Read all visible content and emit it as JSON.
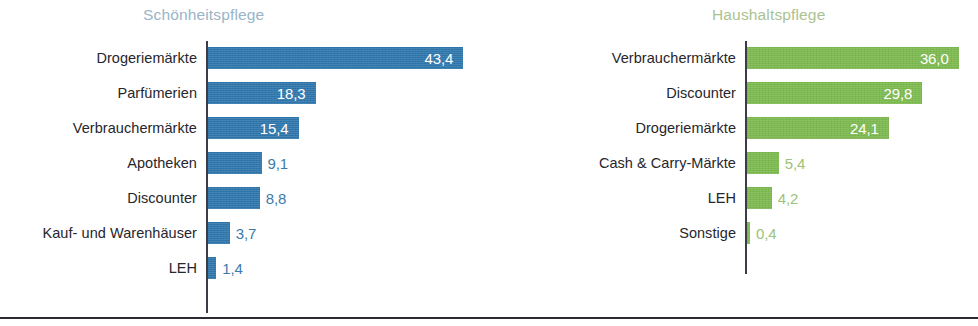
{
  "chart_data": [
    {
      "type": "bar",
      "orientation": "horizontal",
      "title": "Schönheitspflege",
      "title_color": "#9ab4c8",
      "bar_color": "#2e76ac",
      "xlabel": "",
      "ylabel": "",
      "xlim": [
        0,
        43.4
      ],
      "grid": false,
      "legend": false,
      "categories": [
        "Drogeriemärkte",
        "Parfümerien",
        "Verbrauchermärkte",
        "Apotheken",
        "Discounter",
        "Kauf- und Warenhäuser",
        "LEH"
      ],
      "values": [
        43.4,
        18.3,
        15.4,
        9.1,
        8.8,
        3.7,
        1.4
      ],
      "value_labels": [
        "43,4",
        "18,3",
        "15,4",
        "9,1",
        "8,8",
        "3,7",
        "1,4"
      ],
      "label_placement": [
        "inside",
        "inside",
        "inside",
        "outside",
        "outside",
        "outside",
        "outside"
      ]
    },
    {
      "type": "bar",
      "orientation": "horizontal",
      "title": "Haushaltspflege",
      "title_color": "#aac291",
      "bar_color": "#7cb94e",
      "xlabel": "",
      "ylabel": "",
      "xlim": [
        0,
        43.4
      ],
      "grid": false,
      "legend": false,
      "categories": [
        "Verbrauchermärkte",
        "Discounter",
        "Drogeriemärkte",
        "Cash & Carry-Märkte",
        "LEH",
        "Sonstige"
      ],
      "values": [
        36.0,
        29.8,
        24.1,
        5.4,
        4.2,
        0.4
      ],
      "value_labels": [
        "36,0",
        "29,8",
        "24,1",
        "5,4",
        "4,2",
        "0,4"
      ],
      "label_placement": [
        "inside",
        "inside",
        "inside",
        "outside",
        "outside",
        "outside"
      ]
    }
  ]
}
